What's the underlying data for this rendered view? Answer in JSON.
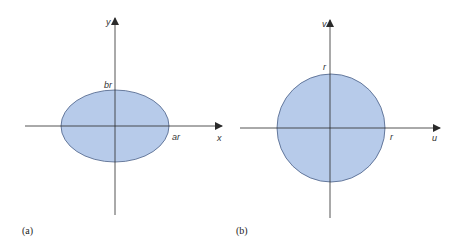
{
  "colors": {
    "fill": "#b7cbea",
    "stroke": "#4a5f86",
    "axis": "#2a2a2a",
    "text": "#333333"
  },
  "panels": [
    {
      "caption": "(a)",
      "shape": "ellipse",
      "axis_labels": {
        "horizontal": "x",
        "vertical": "y"
      },
      "intercept_labels": {
        "horizontal": "ar",
        "vertical": "br"
      }
    },
    {
      "caption": "(b)",
      "shape": "circle",
      "axis_labels": {
        "horizontal": "u",
        "vertical": "v"
      },
      "intercept_labels": {
        "horizontal": "r",
        "vertical": "r"
      }
    }
  ]
}
